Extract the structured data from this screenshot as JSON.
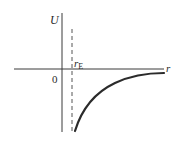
{
  "diagram": {
    "type": "potential-energy-curve",
    "y_axis_label": "U",
    "x_axis_label": "r",
    "origin_label": "0",
    "marker": {
      "symbol": "r",
      "subscript": "E"
    },
    "colors": {
      "axis": "#3a3a3a",
      "curve": "#2b2b2b",
      "dashed": "#555555",
      "text": "#2a2a2a"
    }
  }
}
